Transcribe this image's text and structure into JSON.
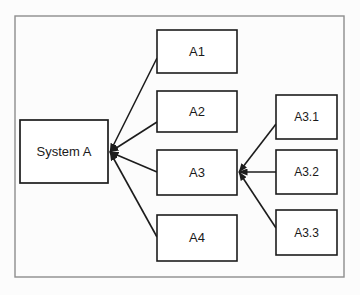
{
  "diagram": {
    "frame": {
      "name": "diagram-frame",
      "x": 15,
      "y": 16,
      "width": 329,
      "height": 261,
      "stroke_color": "#8e8e8e"
    },
    "style": {
      "background_color": "#fcfcfc",
      "node_fill": "#ffffff",
      "node_stroke": "#1c1c1c",
      "connector_color": "#1c1c1c",
      "text_color": "#1a1a1a"
    },
    "nodes": [
      {
        "id": "system-a",
        "label": "System A",
        "x": 20,
        "y": 120,
        "width": 88,
        "height": 63,
        "font_size": 13,
        "stroke_width": 1.7
      },
      {
        "id": "a1",
        "label": "A1",
        "x": 157,
        "y": 30,
        "width": 80,
        "height": 43,
        "font_size": 13,
        "stroke_width": 1.6
      },
      {
        "id": "a2",
        "label": "A2",
        "x": 157,
        "y": 91,
        "width": 80,
        "height": 41,
        "font_size": 13,
        "stroke_width": 1.6
      },
      {
        "id": "a3",
        "label": "A3",
        "x": 157,
        "y": 150,
        "width": 80,
        "height": 45,
        "font_size": 13,
        "stroke_width": 1.6
      },
      {
        "id": "a4",
        "label": "A4",
        "x": 157,
        "y": 215,
        "width": 80,
        "height": 46,
        "font_size": 13,
        "stroke_width": 1.6
      },
      {
        "id": "a31",
        "label": "A3.1",
        "x": 276,
        "y": 95,
        "width": 61,
        "height": 44,
        "font_size": 12,
        "stroke_width": 1.6
      },
      {
        "id": "a32",
        "label": "A3.2",
        "x": 276,
        "y": 150,
        "width": 61,
        "height": 44,
        "font_size": 12,
        "stroke_width": 1.6
      },
      {
        "id": "a33",
        "label": "A3.3",
        "x": 276,
        "y": 210,
        "width": 61,
        "height": 45,
        "font_size": 12,
        "stroke_width": 1.6
      }
    ],
    "connectors": [
      {
        "id": "a1-to-system-a",
        "from": "a1",
        "to": "system-a",
        "x1": 157,
        "y1": 58,
        "x2": 110,
        "y2": 152,
        "arrow_at": "to"
      },
      {
        "id": "a2-to-system-a",
        "from": "a2",
        "to": "system-a",
        "x1": 157,
        "y1": 122,
        "x2": 110,
        "y2": 152,
        "arrow_at": "to"
      },
      {
        "id": "a3-to-system-a",
        "from": "a3",
        "to": "system-a",
        "x1": 157,
        "y1": 172,
        "x2": 110,
        "y2": 152,
        "arrow_at": "to"
      },
      {
        "id": "a4-to-system-a",
        "from": "a4",
        "to": "system-a",
        "x1": 157,
        "y1": 237,
        "x2": 110,
        "y2": 152,
        "arrow_at": "to"
      },
      {
        "id": "a31-to-a3",
        "from": "a31",
        "to": "a3",
        "x1": 276,
        "y1": 124,
        "x2": 239,
        "y2": 172,
        "arrow_at": "to"
      },
      {
        "id": "a32-to-a3",
        "from": "a32",
        "to": "a3",
        "x1": 276,
        "y1": 172,
        "x2": 239,
        "y2": 172,
        "arrow_at": "to"
      },
      {
        "id": "a33-to-a3",
        "from": "a33",
        "to": "a3",
        "x1": 276,
        "y1": 228,
        "x2": 239,
        "y2": 172,
        "arrow_at": "to"
      }
    ]
  }
}
